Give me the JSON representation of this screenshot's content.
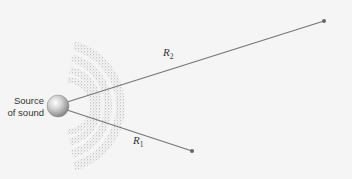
{
  "diagram": {
    "source_label_line1": "Source",
    "source_label_line2": "of sound",
    "r2_label": "R",
    "r2_sub": "2",
    "r1_label": "R",
    "r1_sub": "1",
    "colors": {
      "background": "#f5f5f5",
      "line": "#777777",
      "endpoint": "#666666",
      "wave": "#b8b8b8",
      "sphere_light": "#f0f0f0",
      "sphere_dark": "#8a8a8a"
    }
  }
}
